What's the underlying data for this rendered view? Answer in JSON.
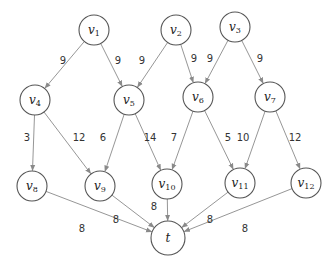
{
  "diagram": {
    "type": "directed-graph",
    "nodes": [
      {
        "id": "v1",
        "base": "v",
        "sub": "1",
        "x": 94,
        "y": 30,
        "r": 15
      },
      {
        "id": "v2",
        "base": "v",
        "sub": "2",
        "x": 176,
        "y": 30,
        "r": 15
      },
      {
        "id": "v3",
        "base": "v",
        "sub": "3",
        "x": 235,
        "y": 27,
        "r": 15
      },
      {
        "id": "v4",
        "base": "v",
        "sub": "4",
        "x": 35,
        "y": 100,
        "r": 15
      },
      {
        "id": "v5",
        "base": "v",
        "sub": "5",
        "x": 129,
        "y": 100,
        "r": 15
      },
      {
        "id": "v6",
        "base": "v",
        "sub": "6",
        "x": 198,
        "y": 97,
        "r": 15
      },
      {
        "id": "v7",
        "base": "v",
        "sub": "7",
        "x": 270,
        "y": 97,
        "r": 15
      },
      {
        "id": "v8",
        "base": "v",
        "sub": "8",
        "x": 32,
        "y": 186,
        "r": 15
      },
      {
        "id": "v9",
        "base": "v",
        "sub": "9",
        "x": 100,
        "y": 186,
        "r": 15
      },
      {
        "id": "v10",
        "base": "v",
        "sub": "10",
        "x": 167,
        "y": 184,
        "r": 15
      },
      {
        "id": "v11",
        "base": "v",
        "sub": "11",
        "x": 240,
        "y": 183,
        "r": 15
      },
      {
        "id": "v12",
        "base": "v",
        "sub": "12",
        "x": 306,
        "y": 183,
        "r": 15
      },
      {
        "id": "t",
        "base": "t",
        "sub": "",
        "x": 168,
        "y": 238,
        "r": 17
      }
    ],
    "edges": [
      {
        "from": "v1",
        "to": "v4",
        "weight": "9",
        "lx": 63,
        "ly": 64
      },
      {
        "from": "v1",
        "to": "v5",
        "weight": "9",
        "lx": 118,
        "ly": 64
      },
      {
        "from": "v2",
        "to": "v5",
        "weight": "9",
        "lx": 142,
        "ly": 64
      },
      {
        "from": "v2",
        "to": "v6",
        "weight": "9",
        "lx": 194,
        "ly": 62
      },
      {
        "from": "v3",
        "to": "v6",
        "weight": "9",
        "lx": 210,
        "ly": 62
      },
      {
        "from": "v3",
        "to": "v7",
        "weight": "9",
        "lx": 260,
        "ly": 62
      },
      {
        "from": "v4",
        "to": "v8",
        "weight": "3",
        "lx": 27,
        "ly": 141
      },
      {
        "from": "v4",
        "to": "v9",
        "weight": "12",
        "lx": 79,
        "ly": 141
      },
      {
        "from": "v5",
        "to": "v9",
        "weight": "6",
        "lx": 103,
        "ly": 141
      },
      {
        "from": "v5",
        "to": "v10",
        "weight": "14",
        "lx": 150,
        "ly": 141
      },
      {
        "from": "v6",
        "to": "v10",
        "weight": "7",
        "lx": 174,
        "ly": 141
      },
      {
        "from": "v6",
        "to": "v11",
        "weight": "5",
        "lx": 228,
        "ly": 141
      },
      {
        "from": "v7",
        "to": "v11",
        "weight": "10",
        "lx": 243,
        "ly": 141
      },
      {
        "from": "v7",
        "to": "v12",
        "weight": "12",
        "lx": 295,
        "ly": 141
      },
      {
        "from": "v8",
        "to": "t",
        "weight": "8",
        "lx": 82,
        "ly": 232
      },
      {
        "from": "v9",
        "to": "t",
        "weight": "8",
        "lx": 116,
        "ly": 223
      },
      {
        "from": "v10",
        "to": "t",
        "weight": "8",
        "lx": 154,
        "ly": 210
      },
      {
        "from": "v11",
        "to": "t",
        "weight": "8",
        "lx": 210,
        "ly": 223
      },
      {
        "from": "v12",
        "to": "t",
        "weight": "8",
        "lx": 245,
        "ly": 232
      }
    ],
    "colors": {
      "edge": "#8a8a8a",
      "node_stroke": "#555555",
      "text": "#222222"
    }
  }
}
